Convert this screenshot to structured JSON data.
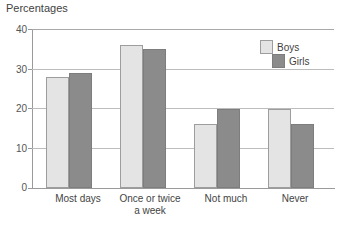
{
  "chart_data": {
    "type": "bar",
    "title": "Percentages",
    "xlabel": "",
    "ylabel": "",
    "ylim": [
      0,
      40
    ],
    "yticks": [
      0,
      10,
      20,
      30,
      40
    ],
    "grid": true,
    "legend_position": "top-right-inside",
    "categories": [
      "Most days",
      "Once or twice\na week",
      "Not much",
      "Never"
    ],
    "series": [
      {
        "name": "Boys",
        "color": "#e4e4e4",
        "values": [
          28,
          36,
          16,
          20
        ]
      },
      {
        "name": "Girls",
        "color": "#8b8b8b",
        "values": [
          29,
          35,
          20,
          16
        ]
      }
    ]
  },
  "axis": {
    "y_tick_labels": [
      "40",
      "30",
      "20",
      "10",
      "0"
    ]
  },
  "legend": {
    "items": [
      {
        "label": "Boys"
      },
      {
        "label": "Girls"
      }
    ]
  }
}
